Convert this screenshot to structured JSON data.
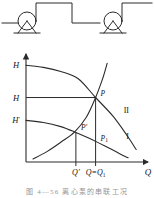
{
  "figure": {
    "caption": "图 4—56  离心泵的串联工况",
    "schematic": {
      "name": "two-pumps-in-series-piping",
      "pump_count": 2,
      "pumps": [
        {
          "label": "pump-left",
          "cx": 27,
          "cy": 23
        },
        {
          "label": "pump-right",
          "cx": 113,
          "cy": 23
        }
      ]
    }
  },
  "chart_data": {
    "type": "line",
    "title": "",
    "xlabel": "Q",
    "ylabel": "H",
    "grid": false,
    "legend": "inline-curve-labels",
    "xlim": [
      0,
      1
    ],
    "ylim": [
      0,
      1
    ],
    "axis_ticks": {
      "y": [
        {
          "label": "H",
          "sublabel": "",
          "value": 0.93,
          "name": "H-top"
        },
        {
          "label": "H",
          "sublabel": "",
          "value": 0.62,
          "name": "H-mid"
        },
        {
          "label": "H",
          "sublabel": "′",
          "value": 0.4,
          "name": "H-prime"
        }
      ],
      "x": [
        {
          "label": "Q′",
          "value": 0.43,
          "name": "Q-prime"
        },
        {
          "label": "Q=Q",
          "sublabel": "1",
          "value": 0.6,
          "name": "Q-equals-Q1"
        }
      ]
    },
    "curves": [
      {
        "name": "series-combined-head-curve",
        "label": "",
        "description": "upper pump head curve (two pumps in series)",
        "points": [
          [
            0.0,
            0.93
          ],
          [
            0.15,
            0.91
          ],
          [
            0.3,
            0.87
          ],
          [
            0.45,
            0.8
          ],
          [
            0.6,
            0.62
          ],
          [
            0.75,
            0.44
          ],
          [
            0.88,
            0.24
          ],
          [
            0.95,
            0.12
          ]
        ]
      },
      {
        "name": "single-pump-head-curve",
        "label": "I",
        "description": "lower single pump head curve",
        "points": [
          [
            0.0,
            0.4
          ],
          [
            0.15,
            0.38
          ],
          [
            0.3,
            0.34
          ],
          [
            0.43,
            0.285
          ],
          [
            0.55,
            0.225
          ],
          [
            0.68,
            0.155
          ],
          [
            0.8,
            0.085
          ],
          [
            0.88,
            0.04
          ]
        ]
      },
      {
        "name": "system-resistance-curve",
        "label": "II",
        "description": "rising pipeline characteristic curve",
        "points": [
          [
            0.06,
            0.03
          ],
          [
            0.18,
            0.1
          ],
          [
            0.3,
            0.19
          ],
          [
            0.42,
            0.29
          ],
          [
            0.52,
            0.43
          ],
          [
            0.6,
            0.62
          ],
          [
            0.66,
            0.8
          ],
          [
            0.7,
            0.95
          ]
        ]
      }
    ],
    "points": [
      {
        "name": "P",
        "label": "P",
        "x": 0.6,
        "y": 0.62,
        "desc": "series operating point"
      },
      {
        "name": "P-prime",
        "label": "P′",
        "sublabel": "",
        "x": 0.43,
        "y": 0.285,
        "desc": "single pump on system curve"
      },
      {
        "name": "P1",
        "label": "P",
        "sublabel": "1",
        "x": 0.6,
        "y": 0.185,
        "desc": "single pump at Q1"
      }
    ],
    "curve_labels": [
      {
        "name": "curve-label-II",
        "text": "II",
        "x": 0.865,
        "y": 0.47
      },
      {
        "name": "curve-label-I",
        "text": "I",
        "x": 0.875,
        "y": 0.22
      }
    ],
    "guide_lines": [
      {
        "name": "horizontal-guide-H",
        "from": [
          0,
          0.62
        ],
        "to": [
          0.6,
          0.62
        ]
      },
      {
        "name": "vertical-guide-Q1",
        "from": [
          0.6,
          0
        ],
        "to": [
          0.6,
          0.62
        ]
      },
      {
        "name": "vertical-guide-Qprime",
        "from": [
          0.43,
          0
        ],
        "to": [
          0.43,
          0.285
        ]
      }
    ]
  }
}
